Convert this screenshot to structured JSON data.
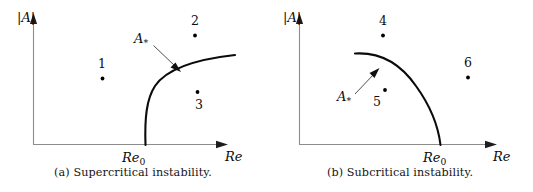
{
  "figure": {
    "title": "",
    "background_color": "#ffffff",
    "curve_color": "#0b0b0b",
    "axis_color": "#8c8c8c",
    "text_color": "#141414"
  },
  "panels": [
    {
      "id": "a",
      "caption": "(a) Supercritical instability.",
      "y_axis_label": "|A|",
      "x_axis_label": "Re",
      "x_threshold_label": "Re",
      "x_threshold_sub": "0",
      "curve_label": "A",
      "curve_label_sub": "*",
      "points": [
        {
          "label": "1"
        },
        {
          "label": "2"
        },
        {
          "label": "3"
        }
      ]
    },
    {
      "id": "b",
      "caption": "(b) Subcritical instability.",
      "y_axis_label": "|A|",
      "x_axis_label": "Re",
      "x_threshold_label": "Re",
      "x_threshold_sub": "0",
      "curve_label": "A",
      "curve_label_sub": "*",
      "points": [
        {
          "label": "4"
        },
        {
          "label": "5"
        },
        {
          "label": "6"
        }
      ]
    }
  ],
  "chart_data": {
    "type": "line",
    "xlabel": "Re",
    "ylabel": "|A|",
    "grid": false,
    "legend": "none",
    "subplots": [
      {
        "name": "(a) Supercritical instability.",
        "annotation": "A_*",
        "xlim": [
          0,
          1
        ],
        "ylim": [
          0,
          1
        ],
        "branch_description": "Amplitude A_* is zero for Re < Re_0 and grows as a square-root-like branch for Re > Re_0",
        "curve_points_normalized": [
          [
            0.56,
            0.0
          ],
          [
            0.58,
            0.3
          ],
          [
            0.63,
            0.5
          ],
          [
            0.72,
            0.65
          ],
          [
            0.85,
            0.74
          ],
          [
            1.0,
            0.8
          ]
        ],
        "marked_points": [
          {
            "label": "1",
            "x": 0.31,
            "y": 0.47
          },
          {
            "label": "2",
            "x": 0.73,
            "y": 0.82
          },
          {
            "label": "3",
            "x": 0.75,
            "y": 0.37
          }
        ]
      },
      {
        "name": "(b) Subcritical instability.",
        "annotation": "A_*",
        "xlim": [
          0,
          1
        ],
        "ylim": [
          0,
          1
        ],
        "branch_description": "Unstable amplitude branch A_* decreases from a finite value at low Re down to zero at Re_0",
        "curve_points_normalized": [
          [
            0.26,
            0.8
          ],
          [
            0.38,
            0.76
          ],
          [
            0.52,
            0.65
          ],
          [
            0.63,
            0.46
          ],
          [
            0.69,
            0.2
          ],
          [
            0.7,
            0.0
          ]
        ],
        "marked_points": [
          {
            "label": "4",
            "x": 0.42,
            "y": 0.82
          },
          {
            "label": "5",
            "x": 0.43,
            "y": 0.42
          },
          {
            "label": "6",
            "x": 0.86,
            "y": 0.58
          }
        ]
      }
    ]
  }
}
